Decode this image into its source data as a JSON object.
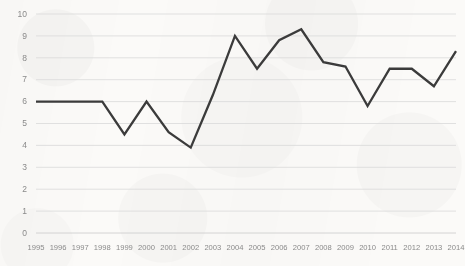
{
  "chart_data": {
    "type": "line",
    "title": "",
    "subtitle": "",
    "xlabel": "",
    "ylabel": "",
    "grid": true,
    "legend": false,
    "legend_position": "none",
    "xlim": [
      1995,
      2014
    ],
    "ylim": [
      0,
      10
    ],
    "ytick_labels": [
      "10",
      "9",
      "8",
      "7",
      "6",
      "5",
      "4",
      "3",
      "2",
      "1",
      "0"
    ],
    "ytick_values": [
      10,
      9,
      8,
      7,
      6,
      5,
      4,
      3,
      2,
      1,
      0
    ],
    "categories": [
      "1995",
      "1996",
      "1997",
      "1998",
      "1999",
      "2000",
      "2001",
      "2002",
      "2003",
      "2004",
      "2005",
      "2006",
      "2007",
      "2008",
      "2009",
      "2010",
      "2011",
      "2012",
      "2013",
      "2014"
    ],
    "x": [
      1995,
      1996,
      1997,
      1998,
      1999,
      2000,
      2001,
      2002,
      2003,
      2004,
      2005,
      2006,
      2007,
      2008,
      2009,
      2010,
      2011,
      2012,
      2013,
      2014
    ],
    "values": [
      6.0,
      6.0,
      6.0,
      6.0,
      4.5,
      6.0,
      4.6,
      3.9,
      6.3,
      9.0,
      7.5,
      8.8,
      9.3,
      7.8,
      7.6,
      5.8,
      7.5,
      7.5,
      6.7,
      8.3
    ],
    "series": [
      {
        "name": "series-1",
        "color": "#3b3b3b",
        "values": [
          6.0,
          6.0,
          6.0,
          6.0,
          4.5,
          6.0,
          4.6,
          3.9,
          6.3,
          9.0,
          7.5,
          8.8,
          9.3,
          7.8,
          7.6,
          5.8,
          7.5,
          7.5,
          6.7,
          8.3
        ]
      }
    ],
    "colors": {
      "line": "#3b3b3b",
      "gridline": "#d9d9d9",
      "tick_label": "#8a8a8a",
      "background": "#fbfaf8"
    }
  }
}
